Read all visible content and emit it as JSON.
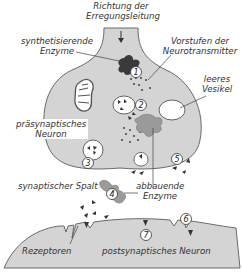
{
  "colors": {
    "cell_fill": "#d4d4d4",
    "outline": "#6a6a6a",
    "synth_enzyme": "#3a3a3a",
    "degrading_enzyme": "#9a9a9a",
    "background": "#ffffff",
    "text": "#333333"
  },
  "labels": {
    "direction_line1": "Richtung der",
    "direction_line2": "Erregungsleitung",
    "synth_line1": "synthetisierende",
    "synth_line2": "Enzyme",
    "precursor_line1": "Vorstufen der",
    "precursor_line2": "Neurotransmitter",
    "empty_vesicle_line1": "leeres",
    "empty_vesicle_line2": "Vesikel",
    "presynaptic_line1": "präsynaptisches",
    "presynaptic_line2": "Neuron",
    "cleft": "synaptischer Spalt",
    "degrading_line1": "abbauende",
    "degrading_line2": "Enzyme",
    "receptors": "Rezeptoren",
    "postsynaptic": "postsynaptisches Neuron"
  },
  "steps": [
    "1",
    "2",
    "3",
    "4",
    "5",
    "6",
    "7"
  ]
}
